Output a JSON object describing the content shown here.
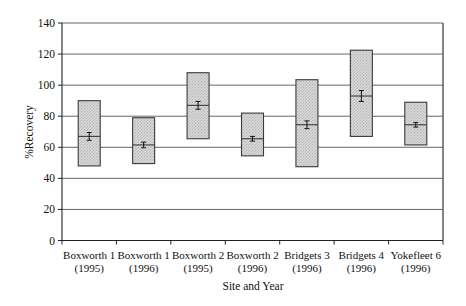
{
  "chart_data": {
    "type": "box",
    "title": "",
    "xlabel": "Site and Year",
    "ylabel": "%Recovery",
    "ylim": [
      0,
      140
    ],
    "yticks": [
      0,
      20,
      40,
      60,
      80,
      100,
      120,
      140
    ],
    "grid": true,
    "legend": null,
    "categories": [
      [
        "Boxworth 1",
        "(1995)"
      ],
      [
        "Boxworth 1",
        "(1996)"
      ],
      [
        "Boxworth 2",
        "(1995)"
      ],
      [
        "Boxworth 2",
        "(1996)"
      ],
      [
        "Bridgets 3",
        "(1996)"
      ],
      [
        "Bridgets 4",
        "(1996)"
      ],
      [
        "Yokefleet 6",
        "(1996)"
      ]
    ],
    "boxes": [
      {
        "low": 48,
        "high": 90,
        "mean": 67,
        "err": 2.5
      },
      {
        "low": 49.5,
        "high": 79,
        "mean": 61.5,
        "err": 1.8
      },
      {
        "low": 65.5,
        "high": 108,
        "mean": 87,
        "err": 2.5
      },
      {
        "low": 54.5,
        "high": 82,
        "mean": 65.5,
        "err": 1.5
      },
      {
        "low": 47.5,
        "high": 103.5,
        "mean": 74.5,
        "err": 2.5
      },
      {
        "low": 67,
        "high": 122.5,
        "mean": 93,
        "err": 3.5
      },
      {
        "low": 61.5,
        "high": 89,
        "mean": 74.5,
        "err": 1.5
      }
    ]
  },
  "colors": {
    "box_fill": "#cdcdcd",
    "box_stroke": "#3a3a3a",
    "grid": "#555555",
    "axis": "#222222"
  }
}
